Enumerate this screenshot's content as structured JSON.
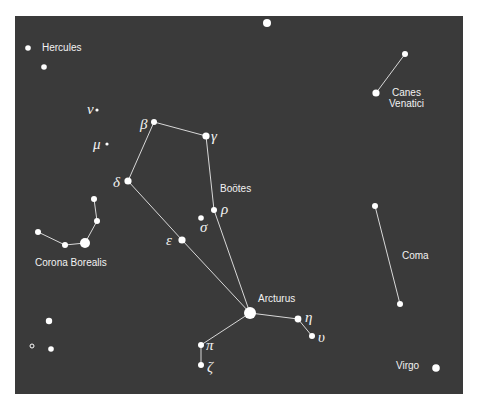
{
  "map": {
    "background": "#3a3a3a",
    "panel": {
      "x": 15,
      "y": 16,
      "w": 448,
      "h": 378
    },
    "star_color": "#ffffff",
    "line_color": "#dddddd"
  },
  "constellations": [
    {
      "name": "Hercules",
      "label_x": 42,
      "label_y": 51
    },
    {
      "name": "Canes Venatici",
      "label_lines": [
        "Canes",
        "Venatici"
      ],
      "label_x": 390,
      "label_y": 97
    },
    {
      "name": "Boötes",
      "label_x": 220,
      "label_y": 193
    },
    {
      "name": "Corona Borealis",
      "label_x": 35,
      "label_y": 266
    },
    {
      "name": "Coma",
      "label_x": 402,
      "label_y": 259
    },
    {
      "name": "Virgo",
      "label_x": 396,
      "label_y": 369
    },
    {
      "name": "Arcturus",
      "label_x": 258,
      "label_y": 303
    }
  ],
  "labels": {
    "hercules": "Hercules",
    "canes1": "Canes",
    "canes2": "Venatici",
    "bootes": "Boötes",
    "corona": "Corona Borealis",
    "coma": "Coma",
    "virgo": "Virgo",
    "arcturus": "Arcturus"
  },
  "greek": {
    "beta": "β",
    "gamma": "γ",
    "delta": "δ",
    "rho": "ρ",
    "sigma": "σ",
    "epsilon": "ε",
    "eta": "η",
    "upsilon": "υ",
    "pi": "π",
    "zeta": "ζ",
    "nu": "ν",
    "mu": "μ"
  },
  "stars": [
    {
      "id": "top",
      "x": 267,
      "y": 23,
      "r": 4
    },
    {
      "id": "herc1",
      "x": 28,
      "y": 48,
      "r": 2.8
    },
    {
      "id": "herc2",
      "x": 44,
      "y": 67,
      "r": 2.8
    },
    {
      "id": "nu",
      "x": 97,
      "y": 110,
      "r": 1.6
    },
    {
      "id": "mu",
      "x": 107,
      "y": 144,
      "r": 1.6
    },
    {
      "id": "beta",
      "x": 154,
      "y": 122,
      "r": 3
    },
    {
      "id": "gamma",
      "x": 206,
      "y": 136,
      "r": 3.6
    },
    {
      "id": "delta",
      "x": 128,
      "y": 181,
      "r": 3.6
    },
    {
      "id": "rho",
      "x": 214,
      "y": 210,
      "r": 3
    },
    {
      "id": "sigma",
      "x": 201,
      "y": 218,
      "r": 2.8
    },
    {
      "id": "epsilon",
      "x": 182,
      "y": 240,
      "r": 3.6
    },
    {
      "id": "arcturus",
      "x": 250,
      "y": 313,
      "r": 6
    },
    {
      "id": "eta",
      "x": 298,
      "y": 319,
      "r": 3.4
    },
    {
      "id": "upsilon",
      "x": 312,
      "y": 336,
      "r": 3
    },
    {
      "id": "pi",
      "x": 201,
      "y": 345,
      "r": 3
    },
    {
      "id": "zeta",
      "x": 201,
      "y": 365,
      "r": 3
    },
    {
      "id": "cv1",
      "x": 405,
      "y": 54,
      "r": 3
    },
    {
      "id": "cv2",
      "x": 376,
      "y": 93,
      "r": 3.6
    },
    {
      "id": "cb1",
      "x": 94,
      "y": 199,
      "r": 3
    },
    {
      "id": "cb2",
      "x": 97,
      "y": 221,
      "r": 3
    },
    {
      "id": "cb3",
      "x": 85,
      "y": 243,
      "r": 5
    },
    {
      "id": "cb4",
      "x": 65,
      "y": 245,
      "r": 3
    },
    {
      "id": "cb5",
      "x": 38,
      "y": 232,
      "r": 3
    },
    {
      "id": "coma1",
      "x": 375,
      "y": 206,
      "r": 3
    },
    {
      "id": "coma2",
      "x": 400,
      "y": 304,
      "r": 3
    },
    {
      "id": "virgo",
      "x": 436,
      "y": 368,
      "r": 3.8
    },
    {
      "id": "s1",
      "x": 49,
      "y": 321,
      "r": 3.2
    },
    {
      "id": "s2",
      "x": 51,
      "y": 349,
      "r": 2.8
    },
    {
      "id": "s3",
      "x": 32,
      "y": 346,
      "r": 2,
      "hollow": true
    }
  ],
  "lines": [
    [
      "beta",
      "gamma"
    ],
    [
      "beta",
      "delta"
    ],
    [
      "gamma",
      "rho"
    ],
    [
      "rho",
      "arcturus"
    ],
    [
      "delta",
      "epsilon"
    ],
    [
      "epsilon",
      "arcturus"
    ],
    [
      "arcturus",
      "eta"
    ],
    [
      "eta",
      "upsilon"
    ],
    [
      "arcturus",
      "pi"
    ],
    [
      "pi",
      "zeta"
    ],
    [
      "cv1",
      "cv2"
    ],
    [
      "cb1",
      "cb2"
    ],
    [
      "cb2",
      "cb3"
    ],
    [
      "cb3",
      "cb4"
    ],
    [
      "cb4",
      "cb5"
    ],
    [
      "coma1",
      "coma2"
    ]
  ]
}
